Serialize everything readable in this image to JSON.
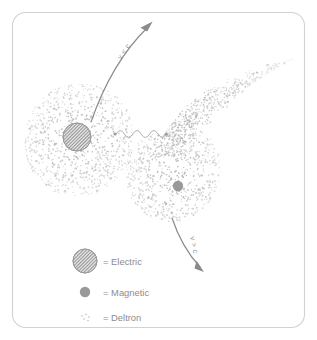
{
  "figure": {
    "name": "electric-magnetic-deltron-diagram",
    "frame": {
      "stroke": "#d2d2d2",
      "radius": 13
    },
    "colors": {
      "arrow": "#8a8a8a",
      "wave": "#b0b0b0",
      "deltron": "#b9b9b9",
      "magnetic": "#999999",
      "electric_outline": "#9a9a9a",
      "text": "#8d8d8d"
    }
  },
  "annotations": {
    "slower_than_light": "v < c",
    "faster_than_light": "v > c"
  },
  "legend": {
    "items": [
      {
        "marker": "hatched-circle-icon",
        "equals": "=",
        "label": "Electric",
        "full": "= Electric"
      },
      {
        "marker": "solid-dot-icon",
        "equals": "=",
        "label": "Magnetic",
        "full": "= Magnetic"
      },
      {
        "marker": "stipple-dots-icon",
        "equals": "=",
        "label": "Deltron",
        "full": "= Deltron"
      }
    ]
  },
  "particles": {
    "electric": {
      "label": "Electric",
      "cx": 77,
      "cy": 137,
      "r": 14
    },
    "magnetic": {
      "label": "Magnetic",
      "cx": 178,
      "cy": 186,
      "r": 5
    }
  },
  "chart_data": {
    "type": "scatter",
    "title": "",
    "clouds": [
      {
        "name": "electric-deltron-cloud",
        "cx": 80,
        "cy": 140,
        "shape": "blob"
      },
      {
        "name": "magnetic-deltron-cloud",
        "cx": 185,
        "cy": 170,
        "shape": "comet"
      }
    ]
  }
}
